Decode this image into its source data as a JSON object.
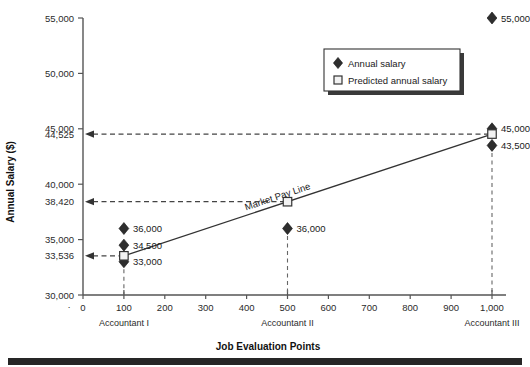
{
  "chart_data": {
    "type": "scatter",
    "title": "",
    "xlabel": "Job Evaluation Points",
    "ylabel": "Annual Salary ($)",
    "xlim": [
      0,
      1000
    ],
    "ylim": [
      30000,
      55000
    ],
    "grid": false,
    "legend_position": "top-right",
    "x_ticks": [
      0,
      100,
      200,
      300,
      400,
      500,
      600,
      700,
      800,
      900,
      1000
    ],
    "x_tick_labels": [
      "0",
      "100",
      "200",
      "300",
      "400",
      "500",
      "600",
      "700",
      "800",
      "900",
      "1,000"
    ],
    "y_ticks": [
      30000,
      35000,
      40000,
      45000,
      50000,
      55000
    ],
    "y_tick_labels": [
      "30,000",
      "35,000",
      "40,000",
      "45,000",
      "50,000",
      "55,000"
    ],
    "y_extra_ticks": [
      33536,
      38420,
      44525
    ],
    "y_extra_tick_labels": [
      "33,536",
      "38,420",
      "44,525"
    ],
    "categories": [
      "Accountant I",
      "Accountant II",
      "Accountant III"
    ],
    "category_x": [
      100,
      500,
      1000
    ],
    "series": [
      {
        "name": "Annual salary",
        "marker": "diamond",
        "points": [
          {
            "x": 100,
            "y": 36000,
            "label": "36,000"
          },
          {
            "x": 100,
            "y": 34500,
            "label": "34,500"
          },
          {
            "x": 100,
            "y": 33000,
            "label": "33,000"
          },
          {
            "x": 500,
            "y": 36000,
            "label": "36,000"
          },
          {
            "x": 1000,
            "y": 55000,
            "label": "55,000"
          },
          {
            "x": 1000,
            "y": 45000,
            "label": "45,000"
          },
          {
            "x": 1000,
            "y": 43500,
            "label": "43,500"
          }
        ]
      },
      {
        "name": "Predicted annual salary",
        "marker": "square",
        "points": [
          {
            "x": 100,
            "y": 33536,
            "label": "33,536"
          },
          {
            "x": 500,
            "y": 38420,
            "label": "38,420"
          },
          {
            "x": 1000,
            "y": 44525,
            "label": "44,525"
          }
        ]
      }
    ],
    "market_pay_line": {
      "label": "Market Pay Line",
      "x1": 100,
      "y1": 33536,
      "x2": 1000,
      "y2": 44525
    },
    "annotations": [
      {
        "type": "arrow-to-axis",
        "y": 44525,
        "from_x": 1000
      },
      {
        "type": "arrow-to-axis",
        "y": 38420,
        "from_x": 500
      },
      {
        "type": "arrow-to-axis",
        "y": 33536,
        "from_x": 100
      },
      {
        "type": "droplines",
        "x_values": [
          100,
          500,
          1000
        ]
      }
    ]
  },
  "legend": {
    "items": [
      {
        "label": "Annual salary",
        "marker": "diamond"
      },
      {
        "label": "Predicted annual salary",
        "marker": "square"
      }
    ]
  }
}
